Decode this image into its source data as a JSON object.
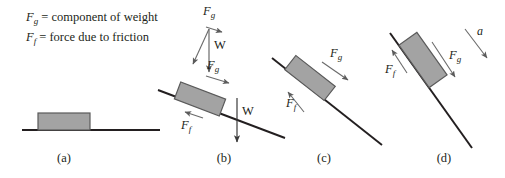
{
  "figure": {
    "background_color": "#ffffff",
    "ink_color": "#231f20",
    "block_fill": "#a3a3a3",
    "block_stroke": "#5a5a5a",
    "arrow_color": "#5b5b5b",
    "line_color": "#231f20"
  },
  "legend": {
    "line1_symbol": "F",
    "line1_sub": "g",
    "line1_text": " = component of weight",
    "line2_symbol": "F",
    "line2_sub": "f",
    "line2_text": " = force due to friction"
  },
  "panels": [
    {
      "id": "a",
      "label": "(a)",
      "incline_angle_deg": 0,
      "surface": {
        "x1": 22,
        "y1": 130,
        "x2": 160,
        "y2": 130
      },
      "block": {
        "cx": 64,
        "cy": 122,
        "w": 52,
        "h": 17,
        "rotation_deg": 0
      },
      "vectors": []
    },
    {
      "id": "b",
      "label": "(b)",
      "incline_angle_deg": 14,
      "surface": {
        "x1": 158,
        "y1": 90,
        "x2": 285,
        "y2": 138
      },
      "block": {
        "cx": 200,
        "cy": 99,
        "w": 48,
        "h": 17,
        "rotation_deg": 14
      },
      "vectors": [
        {
          "name": "Fg-resolution-apex",
          "label": "F",
          "sub": "g",
          "label_x": 203,
          "label_y": 8
        },
        {
          "name": "W-resolution",
          "label": "W",
          "sub": "",
          "label_x": 214,
          "label_y": 42
        },
        {
          "name": "Fg-slope",
          "label": "F",
          "sub": "g",
          "label_x": 207,
          "label_y": 62
        },
        {
          "name": "Ff-slope",
          "label": "F",
          "sub": "f",
          "label_x": 181,
          "label_y": 120
        },
        {
          "name": "W-weight",
          "label": "W",
          "sub": "",
          "label_x": 242,
          "label_y": 104
        }
      ]
    },
    {
      "id": "c",
      "label": "(c)",
      "incline_angle_deg": 25,
      "surface": {
        "x1": 272,
        "y1": 58,
        "x2": 382,
        "y2": 145
      },
      "block": {
        "cx": 310,
        "cy": 76,
        "w": 50,
        "h": 18,
        "rotation_deg": 25
      },
      "vectors": [
        {
          "name": "Fg-slope",
          "label": "F",
          "sub": "g",
          "label_x": 330,
          "label_y": 50
        },
        {
          "name": "Ff-slope",
          "label": "F",
          "sub": "f",
          "label_x": 290,
          "label_y": 98
        }
      ]
    },
    {
      "id": "d",
      "label": "(d)",
      "incline_angle_deg": 50,
      "surface": {
        "x1": 390,
        "y1": 33,
        "x2": 470,
        "y2": 148
      },
      "block": {
        "cx": 423,
        "cy": 57,
        "w": 52,
        "h": 22,
        "rotation_deg": 50
      },
      "vectors": [
        {
          "name": "Fg-slope",
          "label": "F",
          "sub": "g",
          "label_x": 447,
          "label_y": 48
        },
        {
          "name": "Ff-slope",
          "label": "F",
          "sub": "f",
          "label_x": 387,
          "label_y": 62
        },
        {
          "name": "acceleration",
          "label": "a",
          "sub": "",
          "label_x": 473,
          "label_y": 28
        }
      ]
    }
  ],
  "panel_labels": {
    "a": {
      "text": "(a)",
      "x": 44,
      "y": 151
    },
    "b": {
      "text": "(b)",
      "x": 204,
      "y": 151
    },
    "c": {
      "text": "(c)",
      "x": 304,
      "y": 151
    },
    "d": {
      "text": "(d)",
      "x": 424,
      "y": 151
    }
  }
}
